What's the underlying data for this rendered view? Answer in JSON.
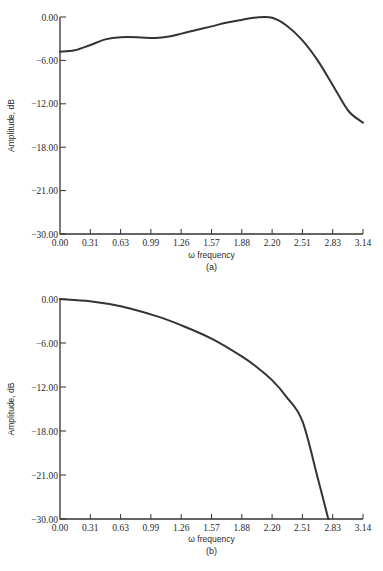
{
  "chart_data": [
    {
      "type": "line",
      "panel": "(a)",
      "title": "",
      "xlabel": "ω frequency",
      "ylabel": "Amplitude, dB",
      "caption": "(a)",
      "xlim": [
        0,
        3.14
      ],
      "ylim": [
        -30,
        0
      ],
      "grid": false,
      "x_ticks": [
        "0.00",
        "0.31",
        "0.63",
        "0.99",
        "1.26",
        "1.57",
        "1.88",
        "2.20",
        "2.51",
        "2.83",
        "3.14"
      ],
      "y_ticks": [
        "0.00",
        "-6.00",
        "-12.00",
        "-18.00",
        "-21.00",
        "-30.00"
      ],
      "series": [
        {
          "name": "amplitude",
          "x": [
            0.0,
            0.15,
            0.31,
            0.47,
            0.63,
            0.8,
            0.99,
            1.13,
            1.26,
            1.41,
            1.57,
            1.72,
            1.88,
            2.04,
            2.2,
            2.35,
            2.51,
            2.67,
            2.83,
            2.99,
            3.14
          ],
          "y": [
            -4.8,
            -4.6,
            -3.9,
            -3.1,
            -2.8,
            -2.8,
            -2.9,
            -2.7,
            -2.3,
            -1.8,
            -1.3,
            -0.8,
            -0.4,
            -0.05,
            -0.1,
            -1.2,
            -3.2,
            -6.0,
            -9.5,
            -13.0,
            -14.6
          ]
        }
      ]
    },
    {
      "type": "line",
      "panel": "(b)",
      "title": "",
      "xlabel": "ω frequency",
      "ylabel": "Amplitude, dB",
      "caption": "(b)",
      "xlim": [
        0,
        3.14
      ],
      "ylim": [
        -30,
        0
      ],
      "grid": false,
      "x_ticks": [
        "0.00",
        "0.31",
        "0.63",
        "0.99",
        "1.26",
        "1.57",
        "1.88",
        "2.20",
        "2.51",
        "2.83",
        "3.14"
      ],
      "y_ticks": [
        "0.00",
        "-6.00",
        "-12.00",
        "-18.00",
        "-21.00",
        "-30.00"
      ],
      "series": [
        {
          "name": "amplitude",
          "x": [
            0.0,
            0.31,
            0.63,
            0.99,
            1.26,
            1.57,
            1.88,
            2.04,
            2.2,
            2.35,
            2.51,
            2.67,
            2.78
          ],
          "y": [
            0.0,
            -0.3,
            -1.0,
            -2.3,
            -3.6,
            -5.4,
            -7.8,
            -9.3,
            -11.1,
            -13.4,
            -16.6,
            -21.5,
            -30.0
          ]
        }
      ]
    }
  ]
}
